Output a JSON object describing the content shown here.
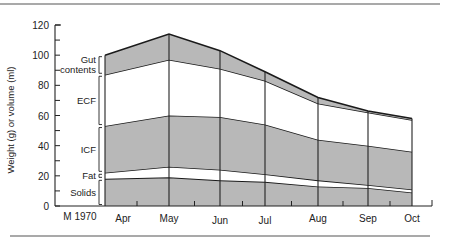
{
  "chart_data": {
    "type": "area",
    "stacked": true,
    "title": "",
    "xlabel": "",
    "ylabel": "Weight (g) or volume (ml)",
    "ylim": [
      0,
      120
    ],
    "yticks": [
      0,
      20,
      40,
      60,
      80,
      100,
      120
    ],
    "start_label": "M 1970",
    "categories": [
      "Apr",
      "May",
      "Jun",
      "Jul",
      "Aug",
      "Sep",
      "Oct"
    ],
    "series": [
      {
        "name": "Solids",
        "values": [
          18,
          19,
          17,
          16,
          13,
          12,
          9
        ],
        "fill": "#b8b8b8"
      },
      {
        "name": "Fat",
        "values": [
          4,
          7,
          7,
          5,
          4,
          2,
          2
        ],
        "fill": "#ffffff"
      },
      {
        "name": "ICF",
        "values": [
          31,
          34,
          35,
          33,
          27,
          26,
          25
        ],
        "fill": "#b8b8b8"
      },
      {
        "name": "ECF",
        "values": [
          34,
          37,
          32,
          29,
          24,
          22,
          21
        ],
        "fill": "#ffffff"
      },
      {
        "name": "Gut contents",
        "values": [
          13,
          17,
          12,
          6,
          4,
          1,
          1
        ],
        "fill": "#b8b8b8"
      }
    ],
    "cumulative_boundaries": {
      "solids_top": [
        18,
        19,
        17,
        16,
        13,
        12,
        9
      ],
      "fat_top": [
        22,
        26,
        24,
        21,
        17,
        14,
        11
      ],
      "icf_top": [
        53,
        60,
        59,
        54,
        44,
        40,
        36
      ],
      "ecf_top": [
        87,
        97,
        91,
        83,
        68,
        62,
        57
      ],
      "gut_top": [
        100,
        114,
        103,
        89,
        72,
        63,
        58
      ]
    },
    "layer_labels": [
      "Gut contents",
      "ECF",
      "ICF",
      "Fat",
      "Solids"
    ],
    "grid": false,
    "legend": "inline-left"
  }
}
